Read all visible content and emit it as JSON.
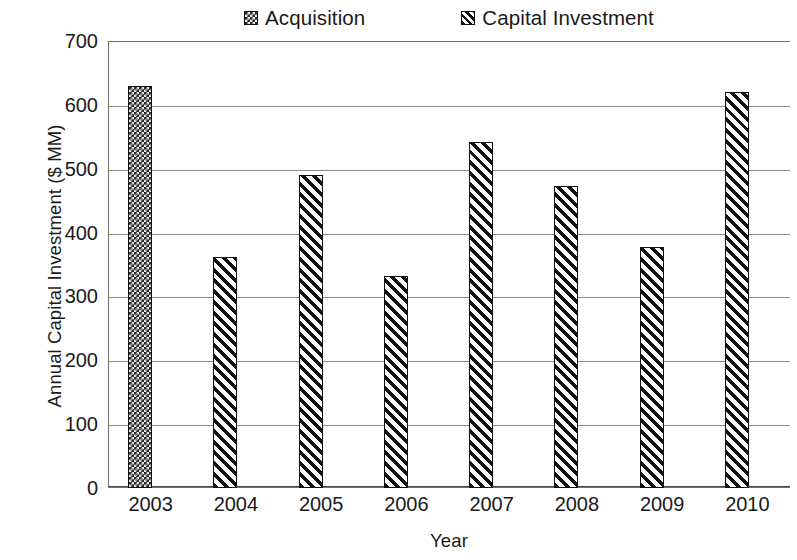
{
  "chart_data": {
    "type": "bar",
    "title": "",
    "xlabel": "Year",
    "ylabel": "Annual Capital Investment ($ MM)",
    "categories": [
      "2003",
      "2004",
      "2005",
      "2006",
      "2007",
      "2008",
      "2009",
      "2010"
    ],
    "ylim": [
      0,
      700
    ],
    "y_ticks": [
      "700",
      "600",
      "500",
      "400",
      "300",
      "200",
      "100",
      "0"
    ],
    "y_tick_values": [
      700,
      600,
      500,
      400,
      300,
      200,
      100,
      0
    ],
    "grid": "horizontal",
    "legend_position": "top",
    "series": [
      {
        "name": "Acquisition",
        "pattern": "checkered-dark",
        "values": [
          630,
          null,
          null,
          null,
          null,
          null,
          null,
          null
        ]
      },
      {
        "name": "Capital Investment",
        "pattern": "diagonal-hatch",
        "values": [
          null,
          362,
          490,
          332,
          542,
          473,
          377,
          620
        ]
      }
    ],
    "bars": [
      {
        "category": "2003",
        "value": 630,
        "series": "Acquisition"
      },
      {
        "category": "2004",
        "value": 362,
        "series": "Capital Investment"
      },
      {
        "category": "2005",
        "value": 490,
        "series": "Capital Investment"
      },
      {
        "category": "2006",
        "value": 332,
        "series": "Capital Investment"
      },
      {
        "category": "2007",
        "value": 542,
        "series": "Capital Investment"
      },
      {
        "category": "2008",
        "value": 473,
        "series": "Capital Investment"
      },
      {
        "category": "2009",
        "value": 377,
        "series": "Capital Investment"
      },
      {
        "category": "2010",
        "value": 620,
        "series": "Capital Investment"
      }
    ],
    "colors": {
      "bar_fill_dark": "#2b2b2b",
      "bar_outline": "#111111",
      "gridline": "#8a8a8a",
      "axis": "#6f6f6f",
      "text": "#1a1a1a",
      "background": "#ffffff"
    }
  },
  "legend": {
    "items": [
      {
        "label": "Acquisition",
        "marker": "checkered-square-icon"
      },
      {
        "label": "Capital Investment",
        "marker": "hatched-square-icon"
      }
    ]
  },
  "axes": {
    "y_title": "Annual Capital Investment ($ MM)",
    "x_title": "Year"
  }
}
